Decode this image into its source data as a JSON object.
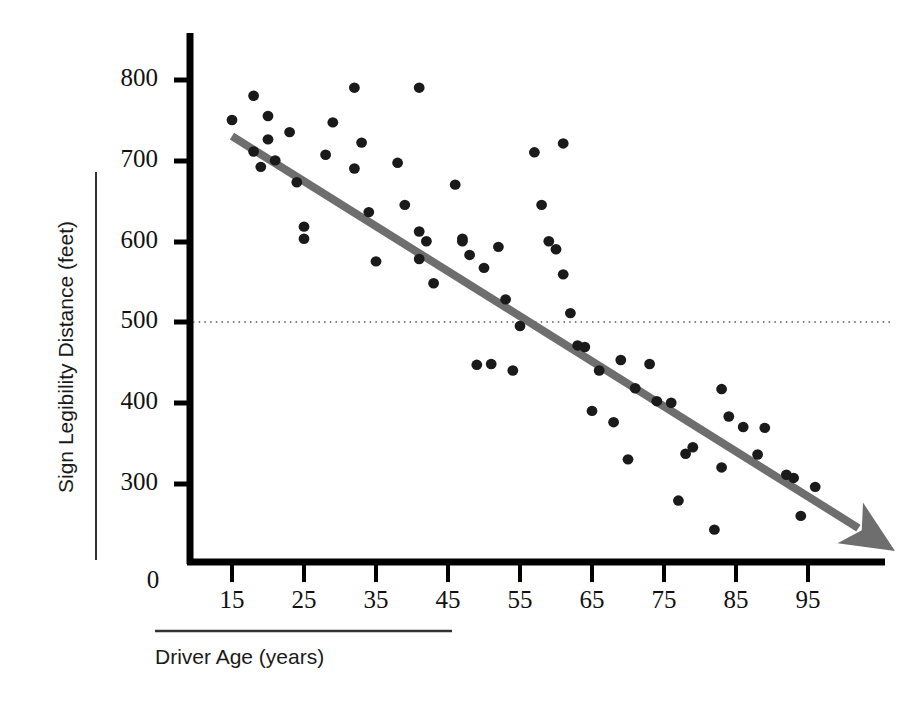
{
  "chart_data": {
    "type": "scatter",
    "title": "",
    "xlabel": "Driver Age (years)",
    "ylabel": "Sign Legibility Distance (feet)",
    "xlim": [
      10,
      102
    ],
    "ylim": [
      215,
      830
    ],
    "xticks": [
      15,
      25,
      35,
      45,
      55,
      65,
      75,
      85,
      95
    ],
    "yticks": [
      300,
      400,
      500,
      600,
      700,
      800
    ],
    "origin_label": "0",
    "grid": false,
    "legend": null,
    "point_color": "#1a1a1a",
    "trendline_color": "#6e6e6e",
    "axis_color": "#000000",
    "reference_line": {
      "orientation": "horizontal",
      "value": 500,
      "style": "dotted",
      "color": "#555555"
    },
    "trendline": {
      "style": "solid-thick-with-arrow",
      "x_start": 15,
      "y_start": 730,
      "x_end": 102,
      "y_end": 245
    },
    "points": [
      {
        "x": 15,
        "y": 750
      },
      {
        "x": 18,
        "y": 780
      },
      {
        "x": 18,
        "y": 711
      },
      {
        "x": 19,
        "y": 692
      },
      {
        "x": 20,
        "y": 755
      },
      {
        "x": 20,
        "y": 726
      },
      {
        "x": 21,
        "y": 700
      },
      {
        "x": 23,
        "y": 735
      },
      {
        "x": 24,
        "y": 673
      },
      {
        "x": 25,
        "y": 618
      },
      {
        "x": 25,
        "y": 603
      },
      {
        "x": 28,
        "y": 707
      },
      {
        "x": 29,
        "y": 747
      },
      {
        "x": 32,
        "y": 790
      },
      {
        "x": 32,
        "y": 690
      },
      {
        "x": 33,
        "y": 722
      },
      {
        "x": 34,
        "y": 636
      },
      {
        "x": 35,
        "y": 575
      },
      {
        "x": 38,
        "y": 697
      },
      {
        "x": 39,
        "y": 645
      },
      {
        "x": 41,
        "y": 790
      },
      {
        "x": 41,
        "y": 612
      },
      {
        "x": 41,
        "y": 578
      },
      {
        "x": 42,
        "y": 600
      },
      {
        "x": 43,
        "y": 548
      },
      {
        "x": 46,
        "y": 670
      },
      {
        "x": 47,
        "y": 603
      },
      {
        "x": 47,
        "y": 600
      },
      {
        "x": 48,
        "y": 583
      },
      {
        "x": 49,
        "y": 447
      },
      {
        "x": 50,
        "y": 567
      },
      {
        "x": 51,
        "y": 448
      },
      {
        "x": 52,
        "y": 593
      },
      {
        "x": 53,
        "y": 528
      },
      {
        "x": 54,
        "y": 440
      },
      {
        "x": 55,
        "y": 495
      },
      {
        "x": 57,
        "y": 710
      },
      {
        "x": 58,
        "y": 645
      },
      {
        "x": 59,
        "y": 600
      },
      {
        "x": 60,
        "y": 590
      },
      {
        "x": 61,
        "y": 721
      },
      {
        "x": 61,
        "y": 559
      },
      {
        "x": 62,
        "y": 511
      },
      {
        "x": 63,
        "y": 471
      },
      {
        "x": 64,
        "y": 469
      },
      {
        "x": 65,
        "y": 390
      },
      {
        "x": 66,
        "y": 440
      },
      {
        "x": 68,
        "y": 376
      },
      {
        "x": 69,
        "y": 453
      },
      {
        "x": 70,
        "y": 330
      },
      {
        "x": 71,
        "y": 418
      },
      {
        "x": 73,
        "y": 448
      },
      {
        "x": 74,
        "y": 402
      },
      {
        "x": 76,
        "y": 400
      },
      {
        "x": 77,
        "y": 279
      },
      {
        "x": 78,
        "y": 337
      },
      {
        "x": 79,
        "y": 345
      },
      {
        "x": 82,
        "y": 243
      },
      {
        "x": 83,
        "y": 417
      },
      {
        "x": 83,
        "y": 320
      },
      {
        "x": 84,
        "y": 383
      },
      {
        "x": 86,
        "y": 370
      },
      {
        "x": 88,
        "y": 336
      },
      {
        "x": 89,
        "y": 369
      },
      {
        "x": 92,
        "y": 311
      },
      {
        "x": 93,
        "y": 307
      },
      {
        "x": 94,
        "y": 260
      },
      {
        "x": 96,
        "y": 296
      }
    ]
  },
  "axes": {
    "y_tick_labels": [
      "800",
      "700",
      "600",
      "500",
      "400",
      "300"
    ],
    "x_tick_labels": [
      "15",
      "25",
      "35",
      "45",
      "55",
      "65",
      "75",
      "85",
      "95"
    ],
    "origin": "0",
    "y_title": "Sign Legibility Distance (feet)",
    "x_title": "Driver Age (years)"
  }
}
